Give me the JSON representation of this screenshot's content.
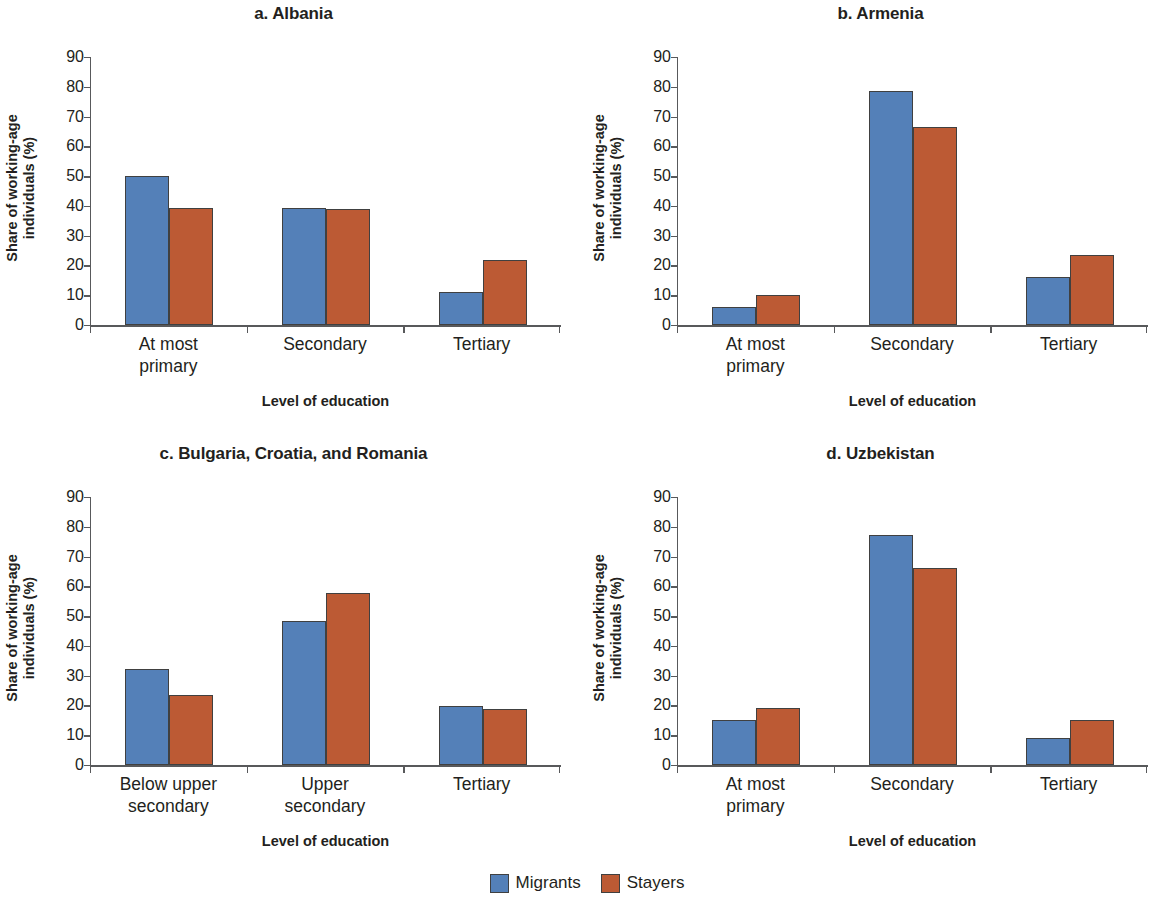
{
  "legend": {
    "items": [
      {
        "label": "Migrants",
        "color": "#5480b8",
        "key": "migrants"
      },
      {
        "label": "Stayers",
        "color": "#bc5a34",
        "key": "stayers"
      }
    ]
  },
  "axis": {
    "ylabel_line1": "Share of working-age",
    "ylabel_line2": "individuals (%)",
    "xlabel": "Level of education",
    "yticks": [
      "90",
      "80",
      "70",
      "60",
      "50",
      "40",
      "30",
      "20",
      "10",
      "0"
    ]
  },
  "panels": [
    {
      "title": "a. Albania",
      "categories": [
        "At most primary",
        "Secondary",
        "Tertiary"
      ],
      "category_lines": [
        [
          "At most",
          "primary"
        ],
        [
          "Secondary"
        ],
        [
          "Tertiary"
        ]
      ]
    },
    {
      "title": "b. Armenia",
      "categories": [
        "At most primary",
        "Secondary",
        "Tertiary"
      ],
      "category_lines": [
        [
          "At most",
          "primary"
        ],
        [
          "Secondary"
        ],
        [
          "Tertiary"
        ]
      ]
    },
    {
      "title": "c. Bulgaria, Croatia, and Romania",
      "categories": [
        "Below upper secondary",
        "Upper secondary",
        "Tertiary"
      ],
      "category_lines": [
        [
          "Below upper",
          "secondary"
        ],
        [
          "Upper",
          "secondary"
        ],
        [
          "Tertiary"
        ]
      ]
    },
    {
      "title": "d. Uzbekistan",
      "categories": [
        "At most primary",
        "Secondary",
        "Tertiary"
      ],
      "category_lines": [
        [
          "At most",
          "primary"
        ],
        [
          "Secondary"
        ],
        [
          "Tertiary"
        ]
      ]
    }
  ],
  "chart_data": [
    {
      "type": "bar",
      "title": "a. Albania",
      "categories": [
        "At most primary",
        "Secondary",
        "Tertiary"
      ],
      "series": [
        {
          "name": "Migrants",
          "color": "#5480b8",
          "values": [
            50.0,
            39.3,
            11.1
          ]
        },
        {
          "name": "Stayers",
          "color": "#bc5a34",
          "values": [
            39.3,
            39.1,
            21.9
          ]
        }
      ],
      "xlabel": "Level of education",
      "ylabel": "Share of working-age individuals (%)",
      "ylim": [
        0,
        90
      ],
      "ytick_step": 10,
      "grid": false,
      "legend_position": "bottom"
    },
    {
      "type": "bar",
      "title": "b. Armenia",
      "categories": [
        "At most primary",
        "Secondary",
        "Tertiary"
      ],
      "series": [
        {
          "name": "Migrants",
          "color": "#5480b8",
          "values": [
            6.0,
            78.5,
            16.0
          ]
        },
        {
          "name": "Stayers",
          "color": "#bc5a34",
          "values": [
            10.0,
            66.5,
            23.5
          ]
        }
      ],
      "xlabel": "Level of education",
      "ylabel": "Share of working-age individuals (%)",
      "ylim": [
        0,
        90
      ],
      "ytick_step": 10,
      "grid": false,
      "legend_position": "bottom"
    },
    {
      "type": "bar",
      "title": "c. Bulgaria, Croatia, and Romania",
      "categories": [
        "Below upper secondary",
        "Upper secondary",
        "Tertiary"
      ],
      "series": [
        {
          "name": "Migrants",
          "color": "#5480b8",
          "values": [
            32.2,
            48.2,
            19.9
          ]
        },
        {
          "name": "Stayers",
          "color": "#bc5a34",
          "values": [
            23.6,
            57.7,
            18.7
          ]
        }
      ],
      "xlabel": "Level of education",
      "ylabel": "Share of working-age individuals (%)",
      "ylim": [
        0,
        90
      ],
      "ytick_step": 10,
      "grid": false,
      "legend_position": "bottom"
    },
    {
      "type": "bar",
      "title": "d. Uzbekistan",
      "categories": [
        "At most primary",
        "Secondary",
        "Tertiary"
      ],
      "series": [
        {
          "name": "Migrants",
          "color": "#5480b8",
          "values": [
            15.0,
            77.2,
            9.1
          ]
        },
        {
          "name": "Stayers",
          "color": "#bc5a34",
          "values": [
            19.0,
            66.0,
            15.0
          ]
        }
      ],
      "xlabel": "Level of education",
      "ylabel": "Share of working-age individuals (%)",
      "ylim": [
        0,
        90
      ],
      "ytick_step": 10,
      "grid": false,
      "legend_position": "bottom"
    }
  ]
}
